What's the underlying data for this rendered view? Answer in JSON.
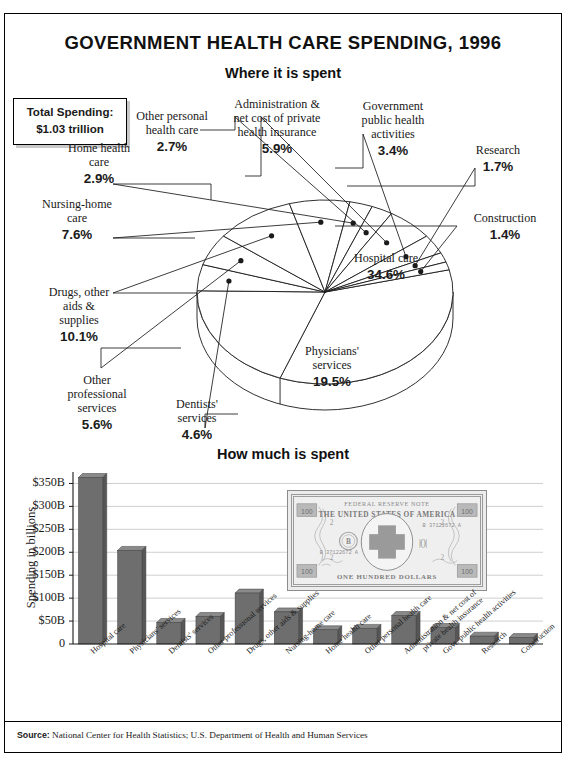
{
  "header": {
    "title": "GOVERNMENT HEALTH CARE SPENDING, 1996",
    "total_box_line1": "Total Spending:",
    "total_box_line2": "$1.03 trillion"
  },
  "sections": {
    "pie_title": "Where it is spent",
    "bar_title": "How much is spent"
  },
  "footer": {
    "source_label": "Source:",
    "source_text": "National Center for Health Statistics; U.S. Department of Health and Human Services"
  },
  "money_illustration": {
    "top_text": "FEDERAL RESERVE NOTE",
    "bank_text": "THE UNITED STATES OF AMERICA",
    "serial_left": "B 37122672 A",
    "serial_right": "B 37122672 A",
    "denomination_left": "2",
    "denomination_right": "2",
    "letter": "B",
    "bottom_text": "ONE HUNDRED DOLLARS",
    "corner_value": "100"
  },
  "colors": {
    "bar_fill": "#6e6e6e",
    "bar_side": "#565656",
    "pie_fill": "#ffffff",
    "pie_stroke": "#1a1a1a",
    "gridline": "#c9c9c9",
    "cross": "#9a9a9a",
    "frame": "#000000"
  },
  "chart_data": [
    {
      "type": "pie",
      "title": "Where it is spent",
      "note": "Total Spending: $1.03 trillion",
      "legend_position": "callouts",
      "categories": [
        "Hospital care",
        "Physicians' services",
        "Dentists' services",
        "Other professional services",
        "Drugs, other aids & supplies",
        "Nursing-home care",
        "Home health care",
        "Other personal health care",
        "Administration & net cost of private health insurance",
        "Government public health activities",
        "Research",
        "Construction"
      ],
      "values": [
        34.6,
        19.5,
        4.6,
        5.6,
        10.1,
        7.6,
        2.9,
        2.7,
        5.9,
        3.4,
        1.7,
        1.4
      ],
      "unit": "%",
      "slices": [
        {
          "label": "Hospital care",
          "value": 34.6,
          "display": "34.6%"
        },
        {
          "label": "Physicians' services",
          "value": 19.5,
          "display": "19.5%"
        },
        {
          "label": "Dentists' services",
          "value": 4.6,
          "display": "4.6%"
        },
        {
          "label": "Other professional services",
          "value": 5.6,
          "display": "5.6%"
        },
        {
          "label": "Drugs, other aids & supplies",
          "value": 10.1,
          "display": "10.1%"
        },
        {
          "label": "Nursing-home care",
          "value": 7.6,
          "display": "7.6%"
        },
        {
          "label": "Home health care",
          "value": 2.9,
          "display": "2.9%"
        },
        {
          "label": "Other personal health care",
          "value": 2.7,
          "display": "2.7%"
        },
        {
          "label": "Administration & net cost of private health insurance",
          "value": 5.9,
          "display": "5.9%"
        },
        {
          "label": "Government public health activities",
          "value": 3.4,
          "display": "3.4%"
        },
        {
          "label": "Research",
          "value": 1.7,
          "display": "1.7%"
        },
        {
          "label": "Construction",
          "value": 1.4,
          "display": "1.4%"
        }
      ]
    },
    {
      "type": "bar",
      "title": "How much is spent",
      "ylabel": "Spending in billions",
      "xlabel": "",
      "ylim": [
        0,
        375
      ],
      "yticks": [
        0,
        50,
        100,
        150,
        200,
        250,
        300,
        350
      ],
      "ytick_labels": [
        "0",
        "$50B",
        "$100B",
        "$150B",
        "$200B",
        "$250B",
        "$300B",
        "$350B"
      ],
      "grid": true,
      "categories": [
        "Hospital care",
        "Physicians' services",
        "Dentists' services",
        "Other professional services",
        "Drugs, other aids & supplies",
        "Nursing-home care",
        "Home health care",
        "Other personal health care",
        "Administration & net cost of\nprivate health insurance",
        "Govt. public health activities",
        "Research",
        "Construction"
      ],
      "values": [
        363,
        204,
        47,
        60,
        111,
        70,
        31,
        34,
        62,
        36,
        17,
        14
      ]
    }
  ],
  "pie_callouts": [
    {
      "label": "Other personal\nhealth care",
      "pct": "2.7%",
      "align": "center"
    },
    {
      "label": "Administration &\nnet cost of private\nhealth insurance",
      "pct": "5.9%",
      "align": "center"
    },
    {
      "label": "Government\npublic health\nactivities",
      "pct": "3.4%",
      "align": "center"
    },
    {
      "label": "Research",
      "pct": "1.7%",
      "align": "center"
    },
    {
      "label": "Construction",
      "pct": "1.4%",
      "align": "center"
    },
    {
      "label": "Hospital care",
      "pct": "34.6%",
      "align": "center"
    },
    {
      "label": "Physicians'\nservices",
      "pct": "19.5%",
      "align": "center"
    },
    {
      "label": "Dentists'\nservices",
      "pct": "4.6%",
      "align": "center"
    },
    {
      "label": "Other\nprofessional\nservices",
      "pct": "5.6%",
      "align": "center"
    },
    {
      "label": "Drugs, other\naids &\nsupplies",
      "pct": "10.1%",
      "align": "center"
    },
    {
      "label": "Nursing-home\ncare",
      "pct": "7.6%",
      "align": "center"
    },
    {
      "label": "Home health\ncare",
      "pct": "2.9%",
      "align": "center"
    }
  ]
}
